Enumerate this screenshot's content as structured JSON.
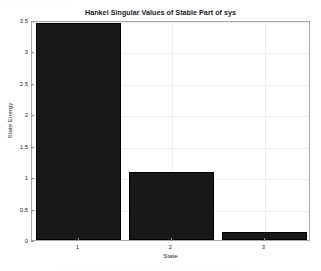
{
  "figure": {
    "title": "Hankel Singular Values of Stable Part of sys",
    "background": "#ffffff",
    "bar_color": "#181818",
    "axis_color": "#a8a8a8",
    "grid_color": "#ededed",
    "top_artifact_text": "·· ··· ·· ···· · ·· ·· ·",
    "bottom_artifact_text": "··· ···· ·· ··· ··· ··· · ·· ·· ·· ··· ·· ·· ··· ··· ·· ·· ·· ·· ··"
  },
  "chart_data": {
    "type": "bar",
    "title": "Hankel Singular Values of Stable Part of sys",
    "xlabel": "State",
    "ylabel": "State Energy",
    "categories": [
      "1",
      "2",
      "3"
    ],
    "values": [
      3.46,
      1.08,
      0.13
    ],
    "ylim": [
      0,
      3.5
    ],
    "xlim": [
      0.5,
      3.5
    ],
    "yticks": [
      0,
      0.5,
      1,
      1.5,
      2,
      2.5,
      3,
      3.5
    ],
    "ytick_labels": [
      "0",
      "0.5",
      "1",
      "1.5",
      "2",
      "2.5",
      "3",
      "3.5"
    ],
    "xticks": [
      1,
      2,
      3
    ],
    "xtick_labels": [
      "1",
      "2",
      "3"
    ],
    "grid": true,
    "legend": null,
    "series": [
      {
        "name": "Hankel singular values",
        "values": [
          3.46,
          1.08,
          0.13
        ],
        "color": "#181818"
      }
    ]
  }
}
